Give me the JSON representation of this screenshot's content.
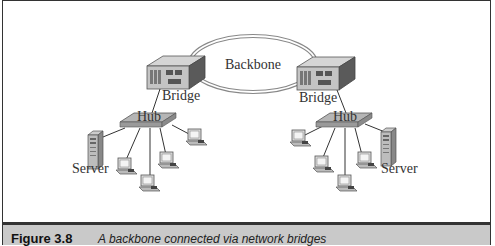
{
  "figure": {
    "backbone_label": "Backbone",
    "left_network": {
      "bridge_label": "Bridge",
      "hub_label": "Hub",
      "server_label": "Server",
      "workstation_count": 4
    },
    "right_network": {
      "bridge_label": "Bridge",
      "hub_label": "Hub",
      "server_label": "Server",
      "workstation_count": 4
    }
  },
  "caption": {
    "figure_number": "Figure 3.8",
    "text": "A backbone connected via network bridges"
  },
  "colors": {
    "caption_bg": "#c9c9c9",
    "device_gray": "#b8b8b8",
    "line": "#333333"
  }
}
